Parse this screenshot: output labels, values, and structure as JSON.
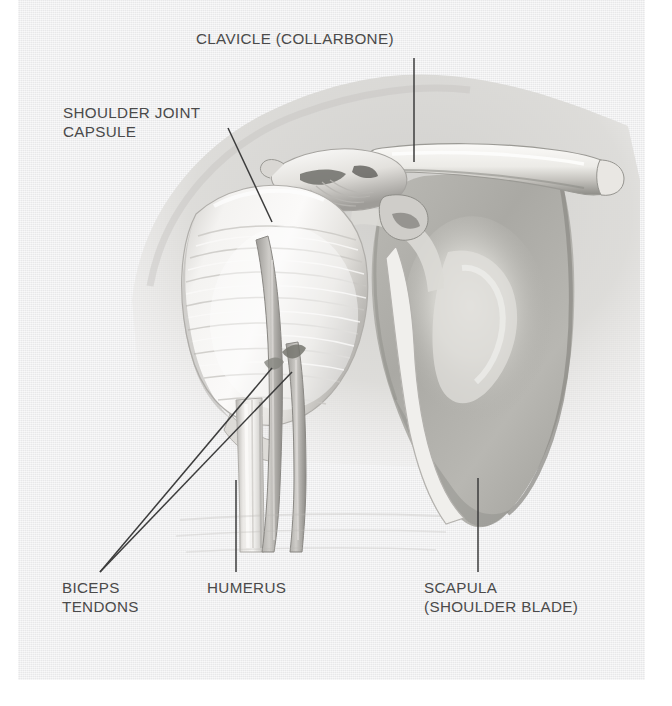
{
  "figure": {
    "kind": "anatomical-illustration",
    "style": "grayscale pencil rendering on textured paper",
    "colors": {
      "paper": "#eeeeef",
      "page_margin": "#ffffff",
      "label_text": "#4a4a4a",
      "leader_line": "#3c3c3c",
      "bone_light": "#f2f0ee",
      "bone_mid": "#cfcdc9",
      "bone_shadow": "#9b9a96",
      "soft_tissue": "#d8d7d3",
      "scapula_body": "#b4b3ae"
    }
  },
  "labels": {
    "clavicle": {
      "text": "CLAVICLE (COLLARBONE)",
      "leader": "vertical"
    },
    "capsule": {
      "text": "SHOULDER JOINT\nCAPSULE",
      "leader": "diagonal-down-right"
    },
    "biceps": {
      "text": "BICEPS\nTENDONS",
      "leader": "two-converging-diagonals"
    },
    "humerus": {
      "text": "HUMERUS",
      "leader": "vertical"
    },
    "scapula": {
      "text": "SCAPULA\n(SHOULDER BLADE)",
      "leader": "vertical"
    }
  },
  "structures": [
    {
      "name": "clavicle",
      "label": "CLAVICLE (COLLARBONE)"
    },
    {
      "name": "shoulder-joint-capsule",
      "label": "SHOULDER JOINT CAPSULE"
    },
    {
      "name": "biceps-tendons",
      "label": "BICEPS TENDONS"
    },
    {
      "name": "humerus",
      "label": "HUMERUS"
    },
    {
      "name": "scapula",
      "label": "SCAPULA (SHOULDER BLADE)"
    },
    {
      "name": "acromion",
      "label": ""
    },
    {
      "name": "coracoid-process",
      "label": ""
    },
    {
      "name": "soft-tissue-shadow",
      "label": ""
    }
  ]
}
